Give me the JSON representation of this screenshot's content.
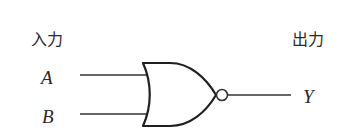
{
  "diagram": {
    "type": "logic-gate",
    "gate": "NOR",
    "input_heading": "入力",
    "output_heading": "出力",
    "inputs": [
      {
        "name": "A"
      },
      {
        "name": "B"
      }
    ],
    "output": {
      "name": "Y"
    }
  }
}
